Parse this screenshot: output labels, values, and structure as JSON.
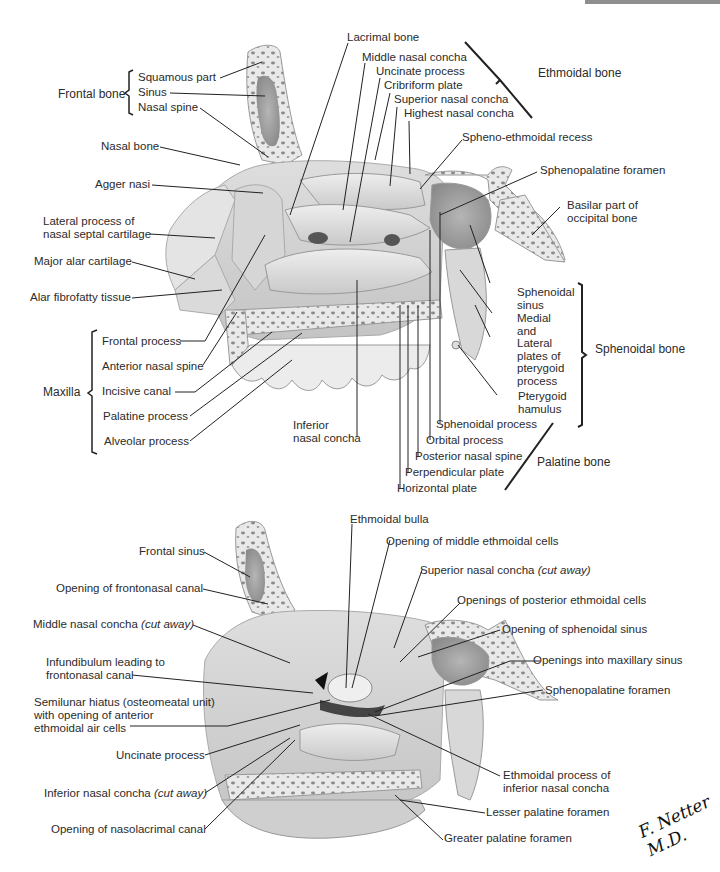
{
  "figure": {
    "signature": "F. Netter M.D."
  },
  "upper": {
    "groups": {
      "frontal_bone": "Frontal bone",
      "ethmoidal_bone": "Ethmoidal bone",
      "sphenoidal_bone": "Sphenoidal bone",
      "maxilla": "Maxilla",
      "palatine_bone": "Palatine bone"
    },
    "labels": {
      "squamous_part": "Squamous part",
      "sinus": "Sinus",
      "nasal_spine": "Nasal spine",
      "nasal_bone": "Nasal bone",
      "agger_nasi": "Agger nasi",
      "lateral_process_1": "Lateral process of",
      "lateral_process_2": "nasal septal cartilage",
      "major_alar": "Major alar cartilage",
      "alar_fibrofatty": "Alar fibrofatty tissue",
      "frontal_process": "Frontal process",
      "anterior_nasal_spine": "Anterior nasal spine",
      "incisive_canal": "Incisive canal",
      "palatine_process": "Palatine process",
      "alveolar_process": "Alveolar process",
      "lacrimal_bone": "Lacrimal bone",
      "middle_nasal_concha": "Middle nasal concha",
      "uncinate_process": "Uncinate process",
      "cribriform_plate": "Cribriform plate",
      "superior_nasal_concha": "Superior nasal concha",
      "highest_nasal_concha": "Highest nasal concha",
      "spheno_ethmoidal_recess": "Spheno-ethmoidal recess",
      "sphenopalatine_foramen": "Sphenopalatine foramen",
      "basilar_part_1": "Basilar part of",
      "basilar_part_2": "occipital bone",
      "sphenoidal_sinus_1": "Sphenoidal",
      "sphenoidal_sinus_2": "sinus",
      "pterygoid_plates_1": "Medial",
      "pterygoid_plates_2": "and",
      "pterygoid_plates_3": "Lateral",
      "pterygoid_plates_4": "plates of",
      "pterygoid_plates_5": "pterygoid",
      "pterygoid_plates_6": "process",
      "pterygoid_hamulus_1": "Pterygoid",
      "pterygoid_hamulus_2": "hamulus",
      "inferior_nasal_concha_1": "Inferior",
      "inferior_nasal_concha_2": "nasal concha",
      "sphenoidal_process": "Sphenoidal process",
      "orbital_process": "Orbital process",
      "posterior_nasal_spine": "Posterior nasal spine",
      "perpendicular_plate": "Perpendicular plate",
      "horizontal_plate": "Horizontal plate"
    }
  },
  "lower": {
    "labels": {
      "frontal_sinus": "Frontal sinus",
      "opening_frontonasal": "Opening of frontonasal canal",
      "middle_concha_cut": "Middle nasal concha",
      "middle_concha_cut_note": "(cut away)",
      "infundibulum_1": "Infundibulum leading to",
      "infundibulum_2": "frontonasal canal",
      "semilunar_1": "Semilunar hiatus (osteomeatal unit)",
      "semilunar_2": "with opening of anterior",
      "semilunar_3": "ethmoidal air cells",
      "uncinate_process": "Uncinate process",
      "inferior_concha_cut": "Inferior nasal concha",
      "inferior_concha_cut_note": "(cut away)",
      "nasolacrimal": "Opening of nasolacrimal canal",
      "ethmoidal_bulla": "Ethmoidal bulla",
      "middle_ethmoidal_cells": "Opening of middle ethmoidal cells",
      "superior_concha_cut": "Superior nasal concha",
      "superior_concha_cut_note": "(cut away)",
      "posterior_ethmoidal_cells": "Openings of posterior ethmoidal cells",
      "sphenoidal_sinus_opening": "Opening of sphenoidal sinus",
      "maxillary_sinus_openings": "Openings into maxillary sinus",
      "sphenopalatine_foramen": "Sphenopalatine foramen",
      "ethmoidal_process_1": "Ethmoidal process of",
      "ethmoidal_process_2": "inferior nasal concha",
      "lesser_palatine": "Lesser palatine foramen",
      "greater_palatine": "Greater palatine foramen"
    }
  },
  "colors": {
    "bone_light": "#e6e6e6",
    "bone_mid": "#cfcfcf",
    "bone_dark": "#9a9a9a",
    "cavity": "#7a7a7a",
    "line": "#222222",
    "header_bar": "#8e8e8e"
  }
}
